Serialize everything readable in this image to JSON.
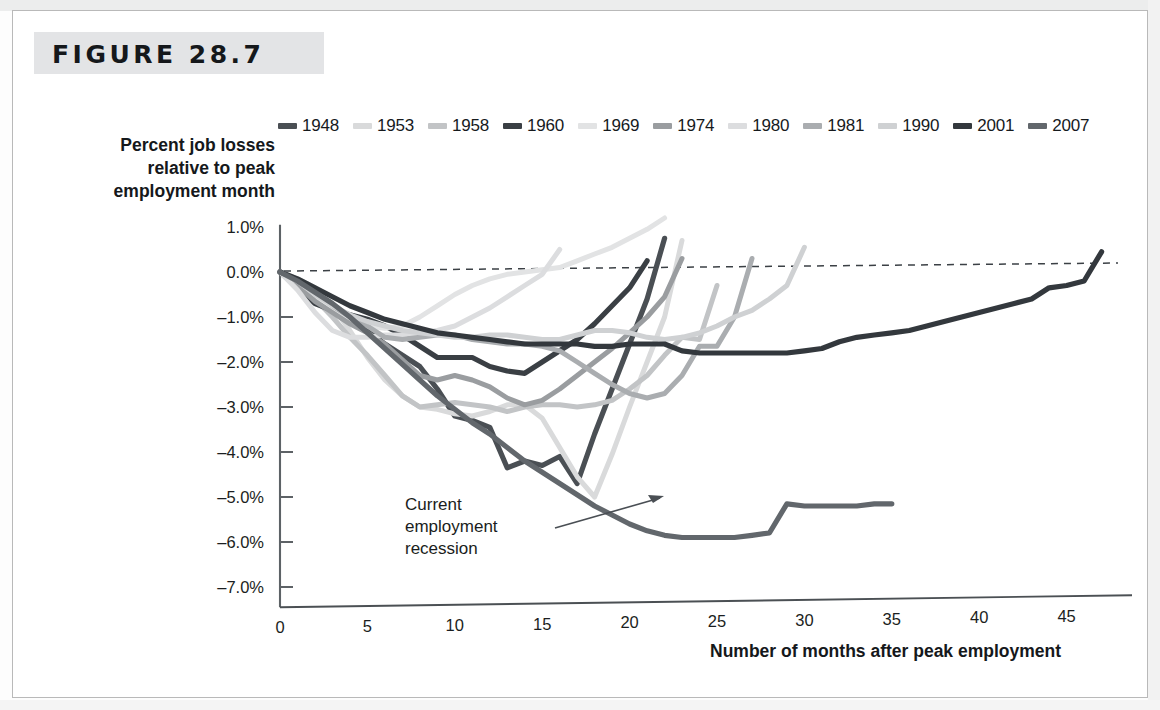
{
  "figure": {
    "label": "FIGURE 28.7"
  },
  "axes": {
    "y_title_line1": "Percent job losses",
    "y_title_line2": "relative to peak",
    "y_title_line3": "employment month",
    "x_title": "Number of months after peak employment",
    "y_ticks": [
      "1.0%",
      "0.0%",
      "–1.0%",
      "–2.0%",
      "–3.0%",
      "–4.0%",
      "–5.0%",
      "–6.0%",
      "–7.0%"
    ],
    "x_ticks": [
      "0",
      "5",
      "10",
      "15",
      "20",
      "25",
      "30",
      "35",
      "40",
      "45"
    ]
  },
  "annotation": {
    "line1": "Current",
    "line2": "employment",
    "line3": "recession"
  },
  "legend": {
    "items": [
      {
        "label": "1948",
        "color": "#4a4f54"
      },
      {
        "label": "1953",
        "color": "#d9dadb"
      },
      {
        "label": "1958",
        "color": "#c2c4c6"
      },
      {
        "label": "1960",
        "color": "#3a3f44"
      },
      {
        "label": "1969",
        "color": "#e2e3e4"
      },
      {
        "label": "1974",
        "color": "#9a9da0"
      },
      {
        "label": "1980",
        "color": "#dcdddf"
      },
      {
        "label": "1981",
        "color": "#aaadb0"
      },
      {
        "label": "1990",
        "color": "#cfd1d3"
      },
      {
        "label": "2001",
        "color": "#33383d"
      },
      {
        "label": "2007",
        "color": "#62676c"
      }
    ]
  },
  "chart_data": {
    "type": "line",
    "title": "FIGURE 28.7",
    "xlabel": "Number of months after peak employment",
    "ylabel": "Percent job losses relative to peak employment month",
    "xlim": [
      0,
      47
    ],
    "ylim": [
      -7.0,
      1.0
    ],
    "grid": false,
    "legend_position": "top",
    "zero_reference_line": {
      "value": 0.0,
      "style": "dashed"
    },
    "annotation_target_series": "2007",
    "series": [
      {
        "name": "1948",
        "color": "#4a4f54",
        "x": [
          0,
          1,
          2,
          3,
          4,
          5,
          6,
          7,
          8,
          9,
          10,
          11,
          12,
          13,
          14,
          15,
          16,
          17,
          18,
          19,
          20,
          21,
          22
        ],
        "values": [
          0.0,
          -0.25,
          -0.45,
          -0.75,
          -1.0,
          -1.3,
          -1.6,
          -1.85,
          -2.1,
          -2.6,
          -3.2,
          -3.3,
          -3.45,
          -4.35,
          -4.2,
          -4.3,
          -4.1,
          -4.7,
          -3.6,
          -2.6,
          -1.6,
          -0.6,
          0.75
        ]
      },
      {
        "name": "1953",
        "color": "#d9dadb",
        "x": [
          0,
          1,
          2,
          3,
          4,
          5,
          6,
          7,
          8,
          9,
          10,
          11,
          12,
          13,
          14,
          15,
          16,
          17,
          18,
          19,
          20,
          21,
          22,
          23
        ],
        "values": [
          0.0,
          -0.15,
          -0.35,
          -0.75,
          -1.3,
          -1.9,
          -2.4,
          -2.75,
          -3.0,
          -3.05,
          -3.15,
          -3.2,
          -3.1,
          -2.95,
          -2.95,
          -3.25,
          -3.9,
          -4.55,
          -5.0,
          -4.05,
          -3.0,
          -2.0,
          -1.0,
          0.7
        ]
      },
      {
        "name": "1958",
        "color": "#c2c4c6",
        "x": [
          0,
          1,
          2,
          3,
          4,
          5,
          6,
          7,
          8,
          9,
          10,
          11,
          12,
          13,
          14,
          15,
          16,
          17,
          18,
          19,
          20,
          21,
          22,
          23,
          24,
          25
        ],
        "values": [
          0.0,
          -0.3,
          -0.6,
          -1.0,
          -1.45,
          -1.85,
          -2.3,
          -2.75,
          -3.0,
          -2.95,
          -2.9,
          -2.95,
          -3.0,
          -3.1,
          -3.0,
          -2.95,
          -2.95,
          -3.0,
          -2.95,
          -2.85,
          -2.6,
          -2.3,
          -1.85,
          -1.45,
          -1.5,
          -0.3
        ]
      },
      {
        "name": "1960",
        "color": "#3a3f44",
        "x": [
          0,
          1,
          2,
          3,
          4,
          5,
          6,
          7,
          8,
          9,
          10,
          11,
          12,
          13,
          14,
          15,
          16,
          17,
          18,
          19,
          20,
          21
        ],
        "values": [
          0.0,
          -0.35,
          -0.7,
          -0.85,
          -0.95,
          -1.05,
          -1.2,
          -1.4,
          -1.65,
          -1.9,
          -1.9,
          -1.9,
          -2.1,
          -2.2,
          -2.25,
          -2.0,
          -1.75,
          -1.5,
          -1.15,
          -0.75,
          -0.35,
          0.25
        ]
      },
      {
        "name": "1969",
        "color": "#e2e3e4",
        "x": [
          0,
          1,
          2,
          3,
          4,
          5,
          6,
          7,
          8,
          9,
          10,
          11,
          12,
          13,
          14,
          15,
          16,
          17,
          18,
          19,
          20,
          21,
          22
        ],
        "values": [
          0.0,
          -0.25,
          -0.5,
          -0.8,
          -1.05,
          -1.2,
          -1.25,
          -1.2,
          -1.0,
          -0.75,
          -0.5,
          -0.3,
          -0.15,
          -0.05,
          0.0,
          0.05,
          0.1,
          0.25,
          0.4,
          0.55,
          0.75,
          0.95,
          1.2
        ]
      },
      {
        "name": "1974",
        "color": "#9a9da0",
        "x": [
          0,
          1,
          2,
          3,
          4,
          5,
          6,
          7,
          8,
          9,
          10,
          11,
          12,
          13,
          14,
          15,
          16,
          17,
          18,
          19,
          20,
          21,
          22,
          23
        ],
        "values": [
          0.0,
          -0.3,
          -0.65,
          -0.9,
          -1.15,
          -1.35,
          -1.6,
          -1.95,
          -2.3,
          -2.4,
          -2.3,
          -2.4,
          -2.55,
          -2.8,
          -2.95,
          -2.85,
          -2.6,
          -2.3,
          -2.0,
          -1.7,
          -1.35,
          -1.0,
          -0.55,
          0.3
        ]
      },
      {
        "name": "1980",
        "color": "#dcdddf",
        "x": [
          0,
          1,
          2,
          3,
          4,
          5,
          6,
          7,
          8,
          9,
          10,
          11,
          12,
          13,
          14,
          15,
          16
        ],
        "values": [
          0.0,
          -0.4,
          -0.9,
          -1.3,
          -1.45,
          -1.45,
          -1.4,
          -1.4,
          -1.35,
          -1.3,
          -1.2,
          -1.0,
          -0.8,
          -0.55,
          -0.3,
          -0.05,
          0.5
        ]
      },
      {
        "name": "1981",
        "color": "#aaadb0",
        "x": [
          0,
          1,
          2,
          3,
          4,
          5,
          6,
          7,
          8,
          9,
          10,
          11,
          12,
          13,
          14,
          15,
          16,
          17,
          18,
          19,
          20,
          21,
          22,
          23,
          24,
          25,
          26,
          27
        ],
        "values": [
          0.0,
          -0.2,
          -0.45,
          -0.75,
          -1.0,
          -1.2,
          -1.45,
          -1.5,
          -1.45,
          -1.4,
          -1.4,
          -1.5,
          -1.55,
          -1.6,
          -1.6,
          -1.65,
          -1.75,
          -2.0,
          -2.25,
          -2.5,
          -2.7,
          -2.8,
          -2.7,
          -2.3,
          -1.65,
          -1.65,
          -1.0,
          0.3
        ]
      },
      {
        "name": "1990",
        "color": "#cfd1d3",
        "x": [
          0,
          1,
          2,
          3,
          4,
          5,
          6,
          7,
          8,
          9,
          10,
          11,
          12,
          13,
          14,
          15,
          16,
          17,
          18,
          19,
          20,
          21,
          22,
          23,
          24,
          25,
          26,
          27,
          28,
          29,
          30
        ],
        "values": [
          0.0,
          -0.2,
          -0.5,
          -0.75,
          -0.95,
          -1.1,
          -1.2,
          -1.3,
          -1.35,
          -1.4,
          -1.45,
          -1.45,
          -1.4,
          -1.4,
          -1.45,
          -1.5,
          -1.5,
          -1.4,
          -1.3,
          -1.3,
          -1.35,
          -1.45,
          -1.5,
          -1.45,
          -1.35,
          -1.2,
          -1.0,
          -0.85,
          -0.6,
          -0.3,
          0.55
        ]
      },
      {
        "name": "2001",
        "color": "#33383d",
        "x": [
          0,
          1,
          2,
          3,
          4,
          5,
          6,
          7,
          8,
          9,
          10,
          11,
          12,
          13,
          14,
          15,
          16,
          17,
          18,
          19,
          20,
          21,
          22,
          23,
          24,
          25,
          26,
          27,
          28,
          29,
          30,
          31,
          32,
          33,
          34,
          35,
          36,
          37,
          38,
          39,
          40,
          41,
          42,
          43,
          44,
          45,
          46,
          47
        ],
        "values": [
          0.0,
          -0.15,
          -0.35,
          -0.55,
          -0.75,
          -0.9,
          -1.05,
          -1.15,
          -1.25,
          -1.35,
          -1.4,
          -1.45,
          -1.5,
          -1.55,
          -1.6,
          -1.6,
          -1.6,
          -1.6,
          -1.65,
          -1.65,
          -1.6,
          -1.6,
          -1.6,
          -1.75,
          -1.8,
          -1.8,
          -1.8,
          -1.8,
          -1.8,
          -1.8,
          -1.75,
          -1.7,
          -1.55,
          -1.45,
          -1.4,
          -1.35,
          -1.3,
          -1.2,
          -1.1,
          -1.0,
          -0.9,
          -0.8,
          -0.7,
          -0.6,
          -0.35,
          -0.3,
          -0.2,
          0.45
        ]
      },
      {
        "name": "2007",
        "color": "#62676c",
        "x": [
          0,
          1,
          2,
          3,
          4,
          5,
          6,
          7,
          8,
          9,
          10,
          11,
          12,
          13,
          14,
          15,
          16,
          17,
          18,
          19,
          20,
          21,
          22,
          23,
          24,
          25,
          26,
          27,
          28,
          29,
          30,
          31,
          32,
          33,
          34,
          35
        ],
        "values": [
          0.0,
          -0.2,
          -0.45,
          -0.7,
          -1.0,
          -1.35,
          -1.7,
          -2.05,
          -2.4,
          -2.75,
          -3.05,
          -3.35,
          -3.6,
          -3.9,
          -4.2,
          -4.45,
          -4.7,
          -4.95,
          -5.2,
          -5.4,
          -5.6,
          -5.75,
          -5.85,
          -5.9,
          -5.9,
          -5.9,
          -5.9,
          -5.85,
          -5.8,
          -5.15,
          -5.2,
          -5.2,
          -5.2,
          -5.2,
          -5.15,
          -5.15
        ]
      }
    ]
  }
}
